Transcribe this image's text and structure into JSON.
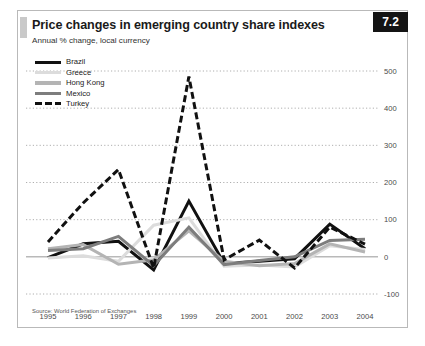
{
  "figure": {
    "badge": "7.2",
    "title": "Price changes in emerging country share indexes",
    "subtitle": "Annual % change, local currency",
    "source": "Source: World Federation of Exchanges"
  },
  "legend": {
    "position": "top-left",
    "items": [
      {
        "label": "Brazil",
        "color": "#111111",
        "style": "solid",
        "width": 3.2
      },
      {
        "label": "Greece",
        "color": "#dcdcdc",
        "style": "solid",
        "width": 3.2
      },
      {
        "label": "Hong Kong",
        "color": "#b4b4b4",
        "style": "solid",
        "width": 3.2
      },
      {
        "label": "Mexico",
        "color": "#7d7d7d",
        "style": "solid",
        "width": 3.2
      },
      {
        "label": "Turkey",
        "color": "#111111",
        "style": "dashed",
        "width": 3.2
      }
    ]
  },
  "chart_data": {
    "type": "line",
    "title": "Price changes in emerging country share indexes",
    "subtitle": "Annual % change, local currency",
    "xlabel": "",
    "ylabel": "Annual % change, local currency",
    "x": [
      1995,
      1996,
      1997,
      1998,
      1999,
      2000,
      2001,
      2002,
      2003,
      2004
    ],
    "categories": [
      "1995",
      "1996",
      "1997",
      "1998",
      "1999",
      "2000",
      "2001",
      "2002",
      "2003",
      "2004"
    ],
    "ylim": [
      -100,
      500
    ],
    "yticks": [
      -100,
      0,
      100,
      200,
      300,
      400,
      500
    ],
    "ytick_labels": [
      "-100",
      "0",
      "100",
      "200",
      "300",
      "400",
      "500"
    ],
    "grid": true,
    "grid_style": "dotted",
    "zero_line": true,
    "series": [
      {
        "name": "Brazil",
        "color": "#111111",
        "style": "solid",
        "values": [
          -2,
          35,
          42,
          -35,
          150,
          -18,
          -12,
          -5,
          88,
          22
        ]
      },
      {
        "name": "Greece",
        "color": "#dcdcdc",
        "style": "solid",
        "values": [
          -3,
          3,
          -12,
          85,
          105,
          -25,
          -22,
          -27,
          30,
          20
        ]
      },
      {
        "name": "Hong Kong",
        "color": "#b4b4b4",
        "style": "solid",
        "values": [
          22,
          33,
          -20,
          -8,
          70,
          -12,
          -24,
          -18,
          35,
          13
        ]
      },
      {
        "name": "Mexico",
        "color": "#7d7d7d",
        "style": "solid",
        "values": [
          17,
          22,
          55,
          -24,
          80,
          -21,
          -10,
          0,
          44,
          47
        ]
      },
      {
        "name": "Turkey",
        "color": "#111111",
        "style": "dashed",
        "values": [
          40,
          145,
          235,
          -30,
          485,
          -8,
          45,
          -30,
          80,
          34
        ]
      }
    ]
  }
}
